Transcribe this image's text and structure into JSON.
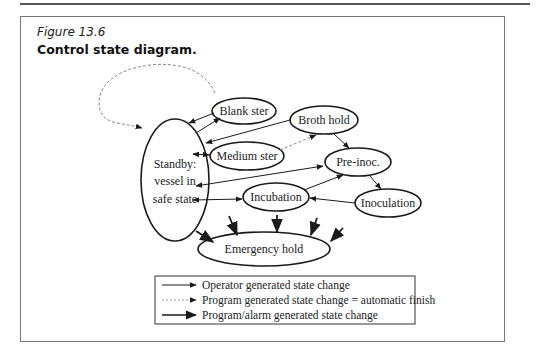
{
  "figure": {
    "label": "Figure 13.6",
    "title": "Control state diagram."
  },
  "nodes": {
    "blank_ster": "Blank ster",
    "broth_hold": "Broth hold",
    "standby_line1": "Standby:",
    "standby_line2": "vessel in",
    "standby_line3": "safe state",
    "medium_ster": "Medium ster",
    "pre_inoc": "Pre-inoc.",
    "incubation": "Incubation",
    "inoculation": "Inoculation",
    "emergency_hold": "Emergency hold"
  },
  "edges": [
    {
      "from": "Standby",
      "to": "Standby",
      "type": "program",
      "note": "dashed self-loop via Blank ster"
    },
    {
      "from": "Blank ster",
      "to": "Standby",
      "type": "operator"
    },
    {
      "from": "Standby",
      "to": "Blank ster",
      "type": "operator"
    },
    {
      "from": "Broth hold",
      "to": "Standby",
      "type": "operator"
    },
    {
      "from": "Standby",
      "to": "Medium ster",
      "type": "operator",
      "bidirectional": true
    },
    {
      "from": "Medium ster",
      "to": "Broth hold",
      "type": "program"
    },
    {
      "from": "Broth hold",
      "to": "Pre-inoc.",
      "type": "operator"
    },
    {
      "from": "Pre-inoc.",
      "to": "Standby",
      "type": "operator",
      "bidirectional": true
    },
    {
      "from": "Standby",
      "to": "Incubation",
      "type": "operator",
      "bidirectional": true
    },
    {
      "from": "Incubation",
      "to": "Pre-inoc.",
      "type": "operator"
    },
    {
      "from": "Pre-inoc.",
      "to": "Inoculation",
      "type": "operator"
    },
    {
      "from": "Inoculation",
      "to": "Incubation",
      "type": "operator"
    },
    {
      "from": "any",
      "to": "Emergency hold",
      "type": "alarm",
      "count": 5
    }
  ],
  "legend": {
    "items": [
      {
        "style": "solid-thin",
        "label": "Operator generated state change"
      },
      {
        "style": "dashed",
        "label": "Program generated state change = automatic finish"
      },
      {
        "style": "solid-thick",
        "label": "Program/alarm generated state change"
      }
    ]
  },
  "colors": {
    "stroke": "#1a1a1a",
    "dashed": "#888888",
    "frame": "#777777"
  }
}
